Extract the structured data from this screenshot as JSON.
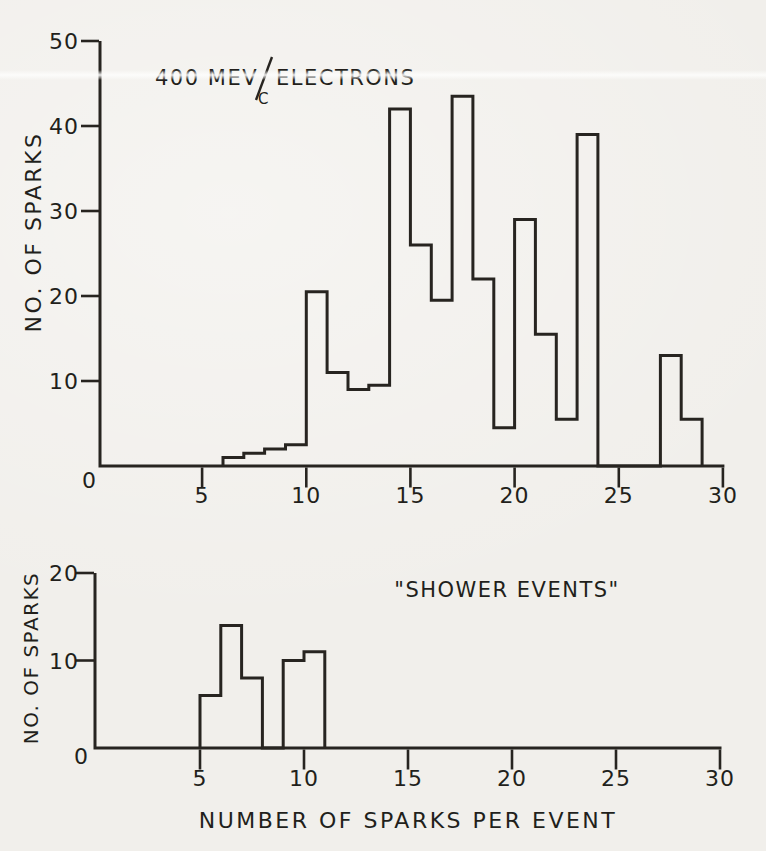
{
  "palette": {
    "paper": "#f1efeb",
    "ink": "#272420"
  },
  "chart_data": [
    {
      "id": "electrons",
      "type": "bar",
      "title": "400 MEV/C ELECTRONS",
      "title_parts": {
        "prefix": "400 MEV",
        "denominator": "C",
        "suffix": "ELECTRONS"
      },
      "xlabel": "",
      "ylabel": "NO. OF SPARKS",
      "xlim": [
        0,
        30
      ],
      "ylim": [
        0,
        50
      ],
      "x_ticks": [
        5,
        10,
        15,
        20,
        25,
        30
      ],
      "y_ticks": [
        0,
        10,
        20,
        30,
        40,
        50
      ],
      "grid": false,
      "legend": null,
      "bins": {
        "start_x": 6,
        "width": 1,
        "values": [
          1,
          1.5,
          2,
          2.5,
          20.5,
          11,
          9,
          9.5,
          42,
          26,
          19.5,
          43.5,
          22,
          4.5,
          29,
          15.5,
          5.5,
          39,
          0,
          0,
          0,
          13,
          5.5
        ]
      }
    },
    {
      "id": "shower-events",
      "type": "bar",
      "title": "\"SHOWER EVENTS\"",
      "xlabel": "NUMBER OF SPARKS PER EVENT",
      "ylabel": "NO. OF SPARKS",
      "xlim": [
        0,
        30
      ],
      "ylim": [
        0,
        20
      ],
      "x_ticks": [
        5,
        10,
        15,
        20,
        25,
        30
      ],
      "y_ticks": [
        0,
        10,
        20
      ],
      "grid": false,
      "legend": null,
      "bins": {
        "start_x": 5,
        "width": 1,
        "values": [
          6,
          14,
          8,
          0,
          10,
          11
        ]
      }
    }
  ]
}
